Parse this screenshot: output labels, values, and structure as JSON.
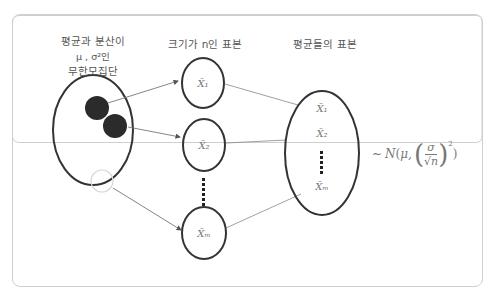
{
  "population": {
    "title_line1": "평균과 분산이",
    "title_line2": "μ , σ²인",
    "title_line3": "무한모집단"
  },
  "samples": {
    "title": "크기가 n인 표본",
    "items": [
      "X̄₁",
      "X̄₂",
      "X̄ₘ"
    ]
  },
  "means": {
    "title": "평균들의 표본",
    "items": [
      "X̄₁",
      "X̄₂",
      "X̄ₘ"
    ]
  },
  "distribution": {
    "tilde": "~",
    "text": "N(μ, (σ/√n)²)",
    "N": "N",
    "mu": "μ,",
    "sigma": "σ",
    "sqrt_n": "√n",
    "power": "2"
  },
  "colors": {
    "border": "#c8c8c8",
    "ellipse_stroke": "#333333",
    "filled_circle": "#2b2b2b",
    "line": "#777777",
    "text": "#555555"
  }
}
